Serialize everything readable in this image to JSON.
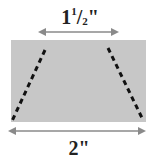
{
  "diagram": {
    "type": "trapezoid-cut-on-rectangle",
    "shape_fill": "#c7c7c7",
    "dash_color": "#111111",
    "arrow_color": "#8a8a8a",
    "top_measure": {
      "whole": "1",
      "num": "1",
      "den": "2",
      "unit": "\""
    },
    "bottom_measure": {
      "text": "2\""
    }
  }
}
